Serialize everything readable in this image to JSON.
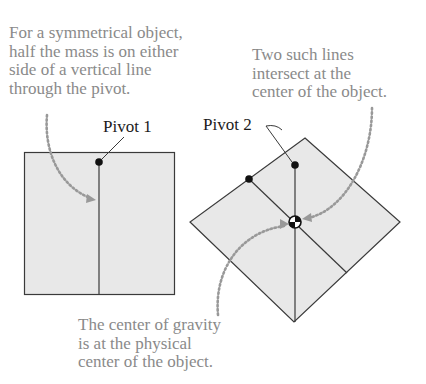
{
  "captions": {
    "symmetry": "For a symmetrical object,\nhalf the mass is on either\nside of a vertical line\nthrough the pivot.",
    "intersect": "Two such lines\nintersect at the\ncenter of the object.",
    "gravity": "The center of gravity\nis at the physical\ncenter of the object."
  },
  "labels": {
    "pivot1": "Pivot 1",
    "pivot2": "Pivot 2"
  },
  "colors": {
    "fill": "#e8e8e8",
    "stroke": "#3a3a3a",
    "arrow": "#999999",
    "caption_text": "#8a8a8a"
  }
}
